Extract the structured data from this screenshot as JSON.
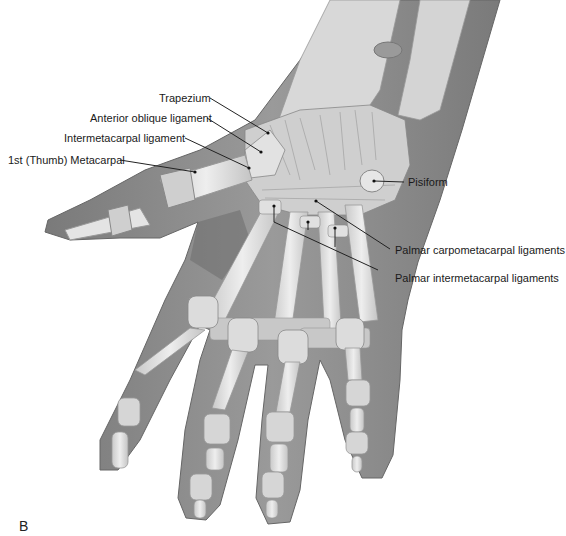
{
  "figure": {
    "panel_letter": "B",
    "colors": {
      "background": "#ffffff",
      "skin": "#8e8e8e",
      "skin_dark": "#6f6f6f",
      "bone": "#d9d9d9",
      "bone_light": "#ececec",
      "ligament": "#c4c4c4",
      "line": "#222222"
    },
    "labels": [
      {
        "id": "trapezium",
        "text": "Trapezium"
      },
      {
        "id": "anterior-oblique-ligament",
        "text": "Anterior oblique ligament"
      },
      {
        "id": "intermetacarpal-ligament",
        "text": "Intermetacarpal ligament"
      },
      {
        "id": "first-metacarpal",
        "text": "1st (Thumb) Metacarpal"
      },
      {
        "id": "pisiform",
        "text": "Pisiform"
      },
      {
        "id": "palmar-carpometacarpal-ligaments",
        "text": "Palmar carpometacarpal ligaments"
      },
      {
        "id": "palmar-intermetacarpal-ligaments",
        "text": "Palmar intermetacarpal ligaments"
      }
    ]
  }
}
